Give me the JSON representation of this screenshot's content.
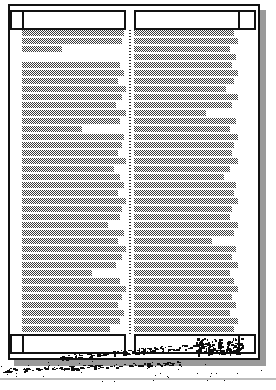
{
  "document": {
    "kind": "scanned-page",
    "description": "Low-resolution dithered scan of a printed two-column document page",
    "orientation": "portrait",
    "columns": 2,
    "page_width_px": 276,
    "page_height_px": 390
  },
  "colors": {
    "ink": "#111111",
    "paper": "#ffffff",
    "dither_ink": "#3b3b3b",
    "shadow": "#9a9a9a",
    "gutter_rule": "#2a2a2a",
    "noise": "#0d0d0d",
    "gray_rule": "#bdbdbd"
  },
  "frame": {
    "sheet": {
      "x": 8,
      "y": 4,
      "w": 252,
      "h": 356
    },
    "shadow": {
      "x": 14,
      "y": 10,
      "w": 252,
      "h": 356,
      "offset_x": 6,
      "offset_y": 6
    },
    "header_band": {
      "y": 10,
      "h": 18
    },
    "footer_band": {
      "y": 336,
      "h": 18
    },
    "left_margin_w": 14,
    "right_margin_w": 14,
    "gutter": {
      "x": 130,
      "y": 28,
      "w": 2,
      "h": 308
    }
  },
  "header": {
    "left_cell": {
      "x": 24,
      "y": 10,
      "w": 100,
      "h": 18,
      "label": ""
    },
    "right_cell": {
      "x": 136,
      "y": 10,
      "w": 100,
      "h": 18,
      "label": ""
    },
    "corner_left": {
      "x": 10,
      "y": 10,
      "w": 12,
      "h": 18
    },
    "corner_right": {
      "x": 240,
      "y": 10,
      "w": 16,
      "h": 18
    }
  },
  "footer": {
    "left_cell": {
      "x": 24,
      "y": 336,
      "w": 100,
      "h": 18,
      "label": ""
    },
    "right_cell": {
      "x": 136,
      "y": 336,
      "w": 100,
      "h": 18,
      "label": ""
    },
    "corner_left": {
      "x": 10,
      "y": 336,
      "w": 12,
      "h": 18
    },
    "corner_right": {
      "x": 240,
      "y": 336,
      "w": 16,
      "h": 18
    }
  },
  "left_column": {
    "x": 22,
    "y": 28,
    "width": 106,
    "line_height": 6,
    "line_pitch": 8,
    "line_widths": [
      102,
      100,
      40,
      0,
      98,
      102,
      96,
      104,
      100,
      94,
      104,
      98,
      60,
      102,
      100,
      96,
      104,
      92,
      98,
      102,
      96,
      104,
      100,
      98,
      86,
      102,
      96,
      104,
      100,
      94,
      70,
      98,
      104,
      100,
      96,
      102,
      98,
      88,
      104
    ]
  },
  "right_column": {
    "x": 136,
    "y": 28,
    "width": 106,
    "line_height": 6,
    "line_pitch": 8,
    "line_widths": [
      100,
      104,
      96,
      102,
      98,
      104,
      100,
      92,
      104,
      98,
      72,
      102,
      96,
      104,
      100,
      98,
      104,
      96,
      90,
      102,
      100,
      104,
      98,
      96,
      104,
      100,
      78,
      102,
      98,
      104,
      96,
      100,
      104,
      98,
      102,
      96,
      104,
      100,
      94
    ]
  },
  "artifacts": {
    "name": "scan-noise",
    "scribble_right": {
      "x": 196,
      "y": 338,
      "w": 46,
      "h": 16
    },
    "streak_bottom": {
      "x": 0,
      "y": 364,
      "w": 180,
      "h": 10
    },
    "gray_rule_bottom": {
      "x": 0,
      "y": 378,
      "w": 276,
      "h": 2
    }
  }
}
